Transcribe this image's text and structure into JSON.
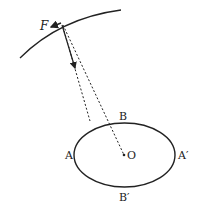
{
  "diagram": {
    "labels": {
      "force": "F",
      "center": "O",
      "A": "A",
      "A_prime": "A′",
      "B": "B",
      "B_prime": "B′"
    },
    "colors": {
      "stroke": "#222222",
      "background": "#ffffff"
    }
  }
}
